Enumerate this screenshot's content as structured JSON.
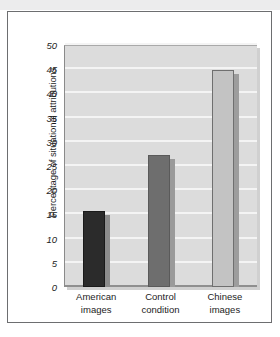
{
  "figure": {
    "background_color": "#ffffff",
    "frame_border_color": "#6d6e70",
    "top_band_color": "#ececed"
  },
  "chart_data": {
    "type": "bar",
    "title": "",
    "xlabel": "",
    "ylabel": "Percentage of situational attributions",
    "categories": [
      "American images",
      "Control condition",
      "Chinese images"
    ],
    "category_lines": [
      [
        "American",
        "images"
      ],
      [
        "Control",
        "condition"
      ],
      [
        "Chinese",
        "images"
      ]
    ],
    "values": [
      15.8,
      27.2,
      44.8
    ],
    "ylim": [
      0,
      50
    ],
    "ytick_labels": [
      "0",
      "5",
      "10",
      "15",
      "20",
      "25",
      "30",
      "35",
      "40",
      "45",
      "50"
    ],
    "ytick_values": [
      0,
      5,
      10,
      15,
      20,
      25,
      30,
      35,
      40,
      45,
      50
    ],
    "grid": true,
    "grid_color": "#f4f4f4",
    "plot_background": "#dcdcdc",
    "legend": null,
    "bar_colors": [
      "#2b2b2b",
      "#6e6e6e",
      "#c3c3c3"
    ],
    "bar_shadow_colors": [
      "#8c8c8c",
      "#9a9a9a",
      "#9d9d9d"
    ],
    "bar_outline_colors": [
      "#1a1a1a",
      "#5a5a5a",
      "#6f6f6f"
    ]
  }
}
